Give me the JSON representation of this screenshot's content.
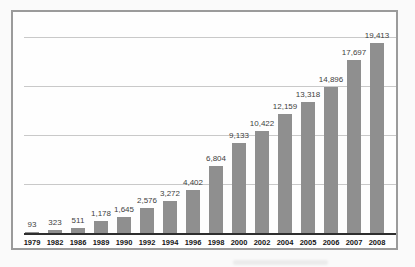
{
  "figure": {
    "background": "#fafafa",
    "frame_border_color": "#9b9b9b",
    "plot_background": "#fefefe"
  },
  "chart_data": {
    "type": "bar",
    "categories": [
      "1979",
      "1982",
      "1986",
      "1989",
      "1990",
      "1992",
      "1994",
      "1996",
      "1998",
      "2000",
      "2002",
      "2004",
      "2005",
      "2006",
      "2007",
      "2008"
    ],
    "values": [
      93,
      323,
      511,
      1178,
      1645,
      2576,
      3272,
      4402,
      6804,
      9133,
      10422,
      12159,
      13318,
      14896,
      17697,
      19413
    ],
    "value_labels": [
      "93",
      "323",
      "511",
      "1,178",
      "1,645",
      "2,576",
      "3,272",
      "4,402",
      "6,804",
      "9,133",
      "10,422",
      "12,159",
      "13,318",
      "14,896",
      "17,697",
      "19,413"
    ],
    "title": "",
    "xlabel": "",
    "ylabel": "",
    "ylim": [
      0,
      20000
    ],
    "gridline_step": 5000,
    "grid": "horizontal",
    "legend": "none",
    "y_tick_labels_visible": false,
    "bar_color": "#8f8f8f",
    "gridline_color": "#c9c9c9",
    "baseline_color": "#2e2e2e",
    "value_label_color": "#3f3f3f",
    "category_label_color": "#141414"
  }
}
